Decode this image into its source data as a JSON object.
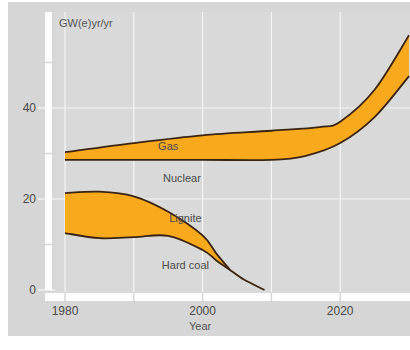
{
  "chart_data": {
    "type": "area",
    "title": "",
    "ylabel": "GW(e)yr/yr",
    "xlabel": "Year",
    "xlim": [
      1978,
      2030
    ],
    "ylim": [
      0,
      58
    ],
    "x_ticks": [
      1980,
      2000,
      2020
    ],
    "x_minor_ticks": [
      1990,
      2010
    ],
    "y_ticks": [
      0,
      20,
      40
    ],
    "y_minor_ticks": [
      10,
      30,
      50
    ],
    "grid": true,
    "bands": [
      {
        "name": "Gas",
        "label": "Gas",
        "label_at": [
          1995,
          30.8
        ],
        "upper": {
          "x": [
            1980,
            1990,
            2000,
            2010,
            2017,
            2020,
            2025,
            2030
          ],
          "y": [
            30.3,
            32.3,
            34.0,
            35.0,
            35.8,
            37.0,
            44.0,
            56.0
          ]
        },
        "lower": {
          "x": [
            1980,
            1990,
            2000,
            2010,
            2015,
            2020,
            2025,
            2030
          ],
          "y": [
            28.6,
            28.6,
            28.6,
            28.6,
            29.5,
            32.3,
            38.0,
            47.0
          ]
        }
      },
      {
        "name": "Lignite",
        "label": "Lignite",
        "label_at": [
          1997.5,
          15.0
        ],
        "upper": {
          "x": [
            1980,
            1985,
            1990,
            1995,
            2000,
            2002,
            2004
          ],
          "y": [
            21.3,
            21.6,
            20.6,
            17.2,
            12.0,
            8.0,
            4.4
          ]
        },
        "lower": {
          "x": [
            1980,
            1985,
            1990,
            1995,
            2000,
            2002,
            2004
          ],
          "y": [
            12.5,
            11.4,
            11.6,
            11.9,
            8.8,
            6.5,
            4.4
          ]
        }
      }
    ],
    "lines": [
      {
        "name": "Hard coal boundary",
        "x": [
          2004,
          2006,
          2009
        ],
        "y": [
          4.4,
          2.3,
          0.0
        ]
      }
    ],
    "region_labels": [
      {
        "text": "Nuclear",
        "at": [
          1997,
          23.8
        ]
      },
      {
        "text": "Hard coal",
        "at": [
          1997.5,
          4.7
        ]
      }
    ],
    "colors": {
      "band_fill": "#f9a91c",
      "band_stroke": "#3a2410",
      "panel_bg": "#d5d6d5",
      "grid": "#f4f4f4"
    }
  }
}
